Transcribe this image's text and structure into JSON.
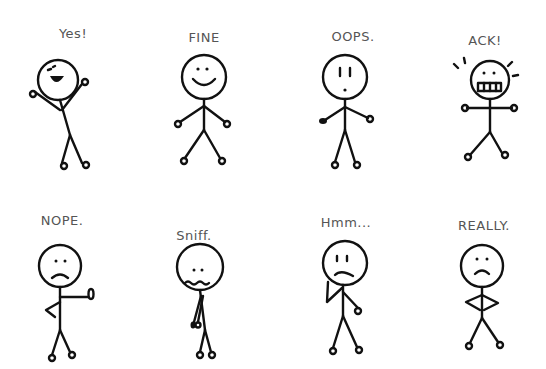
{
  "figures": [
    {
      "label": "Yes!",
      "mood": "excited",
      "x": 60,
      "y": 60
    },
    {
      "label": "FINE",
      "mood": "content",
      "x": 204,
      "y": 63
    },
    {
      "label": "OOPS.",
      "mood": "surprised",
      "x": 345,
      "y": 63
    },
    {
      "label": "ACK!",
      "mood": "panicked",
      "x": 490,
      "y": 65
    },
    {
      "label": "NOPE.",
      "mood": "refusing",
      "x": 60,
      "y": 244
    },
    {
      "label": "Sniff.",
      "mood": "sad",
      "x": 200,
      "y": 246
    },
    {
      "label": "Hmm...",
      "mood": "thinking",
      "x": 345,
      "y": 246
    },
    {
      "label": "REALLY.",
      "mood": "annoyed",
      "x": 484,
      "y": 248
    }
  ],
  "colors": {
    "ink": "#111111",
    "label": "#555555",
    "background": "#ffffff"
  }
}
